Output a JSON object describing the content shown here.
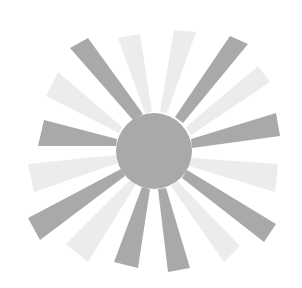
{
  "image": {
    "label": "Sun illustration",
    "description": "Gray sun with a central disc and 16 alternating dark and light tapered rays"
  },
  "colors": {
    "background": "#ffffff",
    "dark": "#a9a9a9",
    "light": "#ececec"
  },
  "sun": {
    "center": [
      154,
      151
    ],
    "radius": 38
  },
  "rays": [
    {
      "tone": "dark",
      "base": [
        [
          133,
          120
        ],
        [
          143,
          114
        ]
      ],
      "tip": [
        [
          70,
          48
        ],
        [
          88,
          38
        ]
      ]
    },
    {
      "tone": "light",
      "base": [
        [
          145,
          113
        ],
        [
          152,
          112
        ]
      ],
      "tip": [
        [
          118,
          38
        ],
        [
          140,
          34
        ]
      ]
    },
    {
      "tone": "light",
      "base": [
        [
          160,
          112
        ],
        [
          167,
          113
        ]
      ],
      "tip": [
        [
          174,
          30
        ],
        [
          196,
          32
        ]
      ]
    },
    {
      "tone": "dark",
      "base": [
        [
          175,
          117
        ],
        [
          183,
          123
        ]
      ],
      "tip": [
        [
          230,
          36
        ],
        [
          248,
          44
        ]
      ]
    },
    {
      "tone": "light",
      "base": [
        [
          186,
          127
        ],
        [
          191,
          135
        ]
      ],
      "tip": [
        [
          258,
          66
        ],
        [
          270,
          82
        ]
      ]
    },
    {
      "tone": "dark",
      "base": [
        [
          191,
          139
        ],
        [
          192,
          148
        ]
      ],
      "tip": [
        [
          276,
          113
        ],
        [
          280,
          136
        ]
      ]
    },
    {
      "tone": "light",
      "base": [
        [
          192,
          158
        ],
        [
          189,
          166
        ]
      ],
      "tip": [
        [
          278,
          164
        ],
        [
          275,
          192
        ]
      ]
    },
    {
      "tone": "dark",
      "base": [
        [
          187,
          170
        ],
        [
          182,
          178
        ]
      ],
      "tip": [
        [
          276,
          224
        ],
        [
          264,
          242
        ]
      ]
    },
    {
      "tone": "light",
      "base": [
        [
          177,
          181
        ],
        [
          171,
          186
        ]
      ],
      "tip": [
        [
          240,
          246
        ],
        [
          224,
          262
        ]
      ]
    },
    {
      "tone": "dark",
      "base": [
        [
          166,
          188
        ],
        [
          158,
          189
        ]
      ],
      "tip": [
        [
          190,
          268
        ],
        [
          168,
          272
        ]
      ]
    },
    {
      "tone": "dark",
      "base": [
        [
          150,
          189
        ],
        [
          142,
          187
        ]
      ],
      "tip": [
        [
          138,
          268
        ],
        [
          114,
          262
        ]
      ]
    },
    {
      "tone": "light",
      "base": [
        [
          136,
          184
        ],
        [
          130,
          180
        ]
      ],
      "tip": [
        [
          88,
          262
        ],
        [
          66,
          244
        ]
      ]
    },
    {
      "tone": "dark",
      "base": [
        [
          125,
          176
        ],
        [
          121,
          169
        ]
      ],
      "tip": [
        [
          40,
          240
        ],
        [
          28,
          218
        ]
      ]
    },
    {
      "tone": "light",
      "base": [
        [
          118,
          163
        ],
        [
          116,
          155
        ]
      ],
      "tip": [
        [
          34,
          192
        ],
        [
          28,
          164
        ]
      ]
    },
    {
      "tone": "dark",
      "base": [
        [
          116,
          146
        ],
        [
          117,
          139
        ]
      ],
      "tip": [
        [
          38,
          146
        ],
        [
          44,
          120
        ]
      ]
    },
    {
      "tone": "light",
      "base": [
        [
          119,
          133
        ],
        [
          122,
          127
        ]
      ],
      "tip": [
        [
          46,
          96
        ],
        [
          58,
          72
        ]
      ]
    }
  ]
}
